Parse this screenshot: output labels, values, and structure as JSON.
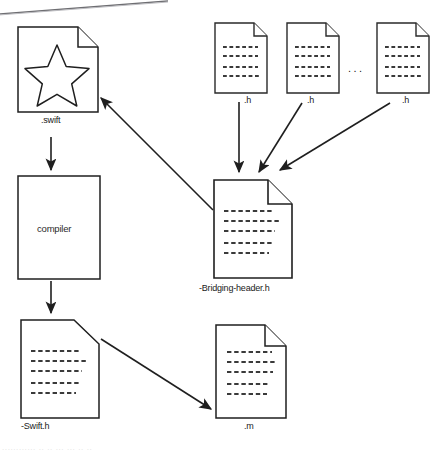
{
  "diagram": {
    "stroke_color": "#1f1f1f",
    "fill_color": "#ffffff",
    "dash_color": "#3a3a3a",
    "nodes": [
      {
        "id": "swift-file",
        "kind": "document-star",
        "label": ".swift",
        "x": 18,
        "y": 27,
        "w": 80,
        "h": 85
      },
      {
        "id": "compiler",
        "kind": "box",
        "label": "compiler",
        "x": 18,
        "y": 176,
        "w": 82,
        "h": 103
      },
      {
        "id": "swift-h-file",
        "kind": "document-cut",
        "label": "-Swift.h",
        "x": 21,
        "y": 320,
        "w": 78,
        "h": 98
      },
      {
        "id": "header-1",
        "kind": "document-lines",
        "label": ".h",
        "x": 215,
        "y": 23,
        "w": 52,
        "h": 70
      },
      {
        "id": "header-2",
        "kind": "document-lines",
        "label": ".h",
        "x": 287,
        "y": 23,
        "w": 52,
        "h": 70
      },
      {
        "id": "header-3",
        "kind": "document-lines",
        "label": ".h",
        "x": 377,
        "y": 23,
        "w": 52,
        "h": 70
      },
      {
        "id": "bridging-header",
        "kind": "document-lines",
        "label": "-Bridging-header.h",
        "x": 214,
        "y": 180,
        "w": 78,
        "h": 98
      },
      {
        "id": "m-file",
        "kind": "document-lines",
        "label": ".m",
        "x": 216,
        "y": 325,
        "w": 70,
        "h": 93
      }
    ],
    "ellipsis": "...",
    "edges": [
      {
        "id": "swift-to-compiler",
        "from": "swift-file",
        "to": "compiler"
      },
      {
        "id": "compiler-to-swift-h",
        "from": "compiler",
        "to": "swift-h-file"
      },
      {
        "id": "header1-to-bridging",
        "from": "header-1",
        "to": "bridging-header"
      },
      {
        "id": "header2-to-bridging",
        "from": "header-2",
        "to": "bridging-header"
      },
      {
        "id": "header3-to-bridging",
        "from": "header-3",
        "to": "bridging-header"
      },
      {
        "id": "bridging-to-swift",
        "from": "bridging-header",
        "to": "swift-file"
      },
      {
        "id": "swift-h-to-m",
        "from": "swift-h-file",
        "to": "m-file"
      }
    ],
    "artifact_caption": "............ ..  ..   ...   ...    ..      .."
  }
}
